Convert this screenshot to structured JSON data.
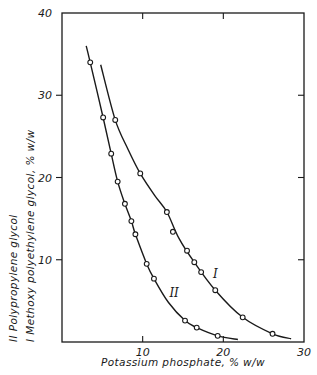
{
  "chart_data": {
    "type": "line",
    "title": "",
    "xlabel": "Potassium phosphate, % w/w",
    "ylabel_lines": [
      "II  Polypropylene glycol",
      "I  Methoxy polyethylene glycol,   % w/w"
    ],
    "xlim": [
      0,
      30
    ],
    "ylim": [
      0,
      40
    ],
    "xticks": [
      10,
      20,
      30
    ],
    "yticks": [
      10,
      20,
      30,
      40
    ],
    "grid": false,
    "legend": "inline curve labels",
    "series": [
      {
        "name": "I",
        "description": "Methoxy polyethylene glycol",
        "marker": "open-circle",
        "points": [
          [
            6.6,
            27.0
          ],
          [
            9.7,
            20.5
          ],
          [
            13.0,
            15.8
          ],
          [
            13.75,
            13.4
          ],
          [
            15.5,
            11.1
          ],
          [
            16.4,
            9.7
          ],
          [
            17.25,
            8.5
          ],
          [
            19.0,
            6.3
          ],
          [
            22.4,
            3.0
          ],
          [
            26.1,
            1.0
          ]
        ],
        "curve": [
          [
            4.8,
            33.7
          ],
          [
            6.6,
            27.0
          ],
          [
            8.2,
            23.4
          ],
          [
            9.7,
            20.5
          ],
          [
            11.5,
            17.8
          ],
          [
            13.0,
            15.8
          ],
          [
            14.5,
            12.6
          ],
          [
            16.4,
            9.7
          ],
          [
            19.0,
            6.3
          ],
          [
            22.4,
            3.0
          ],
          [
            26.1,
            1.0
          ],
          [
            28.4,
            0.4
          ]
        ],
        "label_position": [
          19.0,
          7.8
        ]
      },
      {
        "name": "II",
        "description": "Polypropylene glycol",
        "marker": "open-circle",
        "points": [
          [
            3.5,
            34.0
          ],
          [
            5.1,
            27.3
          ],
          [
            6.1,
            22.9
          ],
          [
            6.9,
            19.5
          ],
          [
            7.8,
            16.8
          ],
          [
            8.6,
            14.7
          ],
          [
            9.1,
            13.1
          ],
          [
            10.5,
            9.5
          ],
          [
            11.4,
            7.7
          ],
          [
            15.25,
            2.6
          ],
          [
            16.7,
            1.75
          ],
          [
            19.3,
            0.75
          ]
        ],
        "curve": [
          [
            3.0,
            36.0
          ],
          [
            3.5,
            34.0
          ],
          [
            5.1,
            27.3
          ],
          [
            6.1,
            22.9
          ],
          [
            6.9,
            19.5
          ],
          [
            7.8,
            16.8
          ],
          [
            8.6,
            14.7
          ],
          [
            9.1,
            13.1
          ],
          [
            10.5,
            9.5
          ],
          [
            11.4,
            7.7
          ],
          [
            13.2,
            4.8
          ],
          [
            15.25,
            2.6
          ],
          [
            16.7,
            1.75
          ],
          [
            19.3,
            0.75
          ],
          [
            21.8,
            0.3
          ]
        ],
        "label_position": [
          13.9,
          5.5
        ]
      }
    ]
  },
  "style": {
    "ink": "#1a1a1a",
    "background": "#ffffff"
  }
}
